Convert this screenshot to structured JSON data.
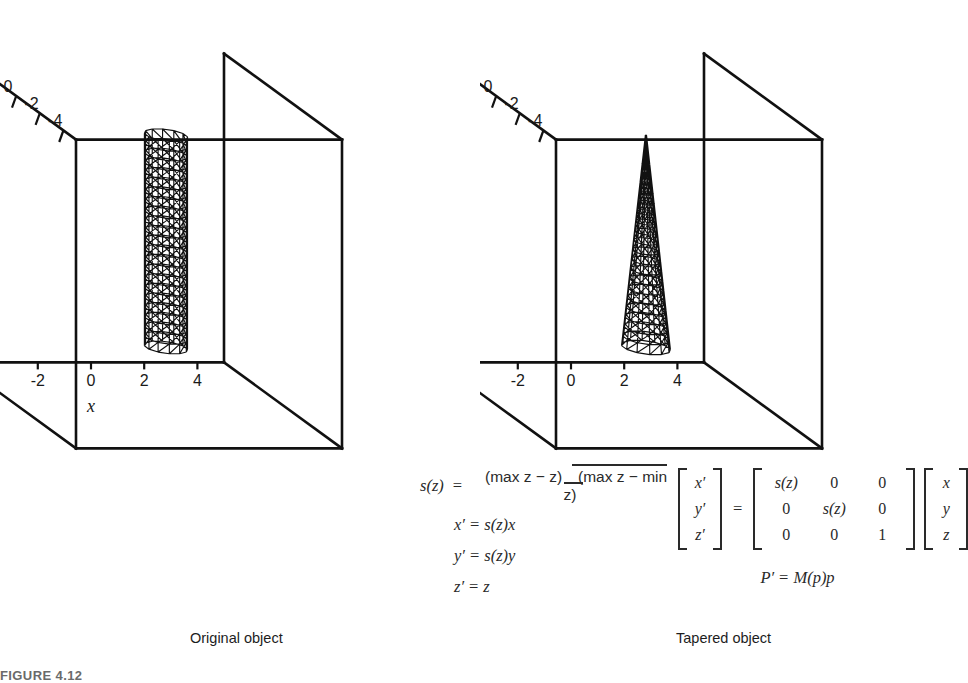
{
  "chart_data": {
    "type": "scatter",
    "title": "",
    "panels": [
      {
        "id": "left",
        "caption": "Original object",
        "object": "cylinder",
        "xlabel": "x",
        "ylabel": "y",
        "zlabel": "z",
        "show_axis_name_x": true,
        "show_axis_name_y": true,
        "show_axis_name_z": true,
        "xticks": [
          "-4",
          "-2",
          "0",
          "2",
          "4"
        ],
        "xtick_values": [
          -4,
          -2,
          0,
          2,
          4
        ],
        "yticks": [
          "4",
          "2",
          "0",
          "-2",
          "-4"
        ],
        "ytick_values": [
          4,
          2,
          0,
          -2,
          -4
        ],
        "zticks": [
          "4",
          "2",
          "0",
          "-2",
          "-4"
        ],
        "ztick_values": [
          4,
          2,
          0,
          -2,
          -4
        ],
        "xlim": [
          -5,
          5
        ],
        "ylim": [
          -5,
          5
        ],
        "zlim": [
          -4,
          4
        ],
        "grid": false,
        "object_geometry": {
          "shape": "cylinder",
          "radius_top": 0.75,
          "radius_bottom": 0.75,
          "z_bottom": -2.5,
          "z_top": 3.0,
          "center_x": 0.6,
          "center_y": 0.0,
          "radial_segments": 12,
          "height_segments": 22
        }
      },
      {
        "id": "right",
        "caption": "Tapered object",
        "object": "cone",
        "xlabel": "",
        "ylabel": "y",
        "zlabel": "z",
        "show_axis_name_x": false,
        "show_axis_name_y": false,
        "show_axis_name_z": false,
        "xticks": [
          "-4",
          "-2",
          "0",
          "2",
          "4"
        ],
        "xtick_values": [
          -4,
          -2,
          0,
          2,
          4
        ],
        "yticks": [
          "4",
          "2",
          "0",
          "-2",
          "-4"
        ],
        "ytick_values": [
          4,
          2,
          0,
          -2,
          -4
        ],
        "zticks": [
          "4",
          "2",
          "0",
          "-2",
          "-4"
        ],
        "ztick_values": [
          4,
          2,
          0,
          -2,
          -4
        ],
        "xlim": [
          -5,
          5
        ],
        "ylim": [
          -5,
          5
        ],
        "zlim": [
          -4,
          4
        ],
        "grid": false,
        "object_geometry": {
          "shape": "cone",
          "radius_top": 0.02,
          "radius_bottom": 0.85,
          "z_bottom": -2.5,
          "z_top": 3.0,
          "center_x": 0.6,
          "center_y": 0.0,
          "radial_segments": 12,
          "height_segments": 22
        }
      }
    ]
  },
  "equations": {
    "s_of_z": {
      "lhs": "s(z)",
      "equals": "=",
      "numerator": "(max z − z)",
      "denominator": "(max z − min z)"
    },
    "component_lines": [
      {
        "lhs": "x′",
        "op": "=",
        "rhs": "s(z)x"
      },
      {
        "lhs": "y′",
        "op": "=",
        "rhs": "s(z)y"
      },
      {
        "lhs": "z′",
        "op": "=",
        "rhs": "z"
      }
    ],
    "matrix_form": {
      "result_vector": [
        "x′",
        "y′",
        "z′"
      ],
      "equals": "=",
      "matrix": [
        [
          "s(z)",
          "0",
          "0"
        ],
        [
          "0",
          "s(z)",
          "0"
        ],
        [
          "0",
          "0",
          "1"
        ]
      ],
      "input_vector": [
        "x",
        "y",
        "z"
      ]
    },
    "matrix_summary": {
      "lhs": "P′",
      "op": "=",
      "rhs": "M(p)p"
    }
  },
  "captions": {
    "left": "Original object",
    "right": "Tapered object"
  },
  "figure_number": "FIGURE 4.12",
  "colors": {
    "ink": "#111111",
    "text": "#1a1a1a",
    "background": "#ffffff",
    "figure_number": "#6a6a6a"
  }
}
